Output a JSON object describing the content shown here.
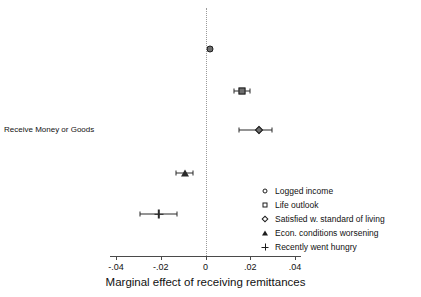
{
  "chart_data": {
    "type": "scatter",
    "title": "",
    "subtitle": "",
    "xlabel": "Marginal effect of receiving remittances",
    "ylabel": "Receive Money or Goods",
    "xlim": [
      -0.05,
      0.05
    ],
    "xticks": [
      -0.04,
      -0.02,
      0,
      0.02,
      0.04
    ],
    "xticklabels": [
      "-.04",
      "-.02",
      "0",
      ".02",
      ".04"
    ],
    "grid": false,
    "reference_line": 0,
    "reference_line_style": "dotted",
    "legend_position": "right-inside",
    "series": [
      {
        "name": "Logged income",
        "marker": "circle",
        "estimate": 0.002,
        "ci_low": 0.0013,
        "ci_high": 0.0027,
        "row": 0
      },
      {
        "name": "Life outlook",
        "marker": "square",
        "estimate": 0.0163,
        "ci_low": 0.0128,
        "ci_high": 0.0199,
        "row": 1
      },
      {
        "name": "Satisfied w. standard of living",
        "marker": "diamond",
        "estimate": 0.0237,
        "ci_low": 0.0151,
        "ci_high": 0.0297,
        "row": 2
      },
      {
        "name": "Econ. conditions worsening",
        "marker": "triangle",
        "estimate": -0.009,
        "ci_low": -0.013,
        "ci_high": -0.0054,
        "row": 3
      },
      {
        "name": "Recently went hungry",
        "marker": "plus",
        "estimate": -0.0209,
        "ci_low": -0.0292,
        "ci_high": -0.0126,
        "row": 4
      }
    ],
    "legend": [
      {
        "label": "Logged income",
        "marker": "circle"
      },
      {
        "label": "Life outlook",
        "marker": "square"
      },
      {
        "label": "Satisfied w. standard of living",
        "marker": "diamond"
      },
      {
        "label": "Econ. conditions worsening",
        "marker": "triangle"
      },
      {
        "label": "Recently went hungry",
        "marker": "plus"
      }
    ]
  },
  "axis": {
    "x_title": "Marginal effect of receiving remittances",
    "y_category_label": "Receive Money or Goods",
    "tick_labels": [
      "-.04",
      "-.02",
      "0",
      ".02",
      ".04"
    ]
  },
  "colors": {
    "marker_fill": "#6e6e6e",
    "marker_edge": "#1d1d1d",
    "axis": "#4a4a4a",
    "reference_line": "#9a9a9a",
    "text": "#111111",
    "background": "#ffffff"
  }
}
